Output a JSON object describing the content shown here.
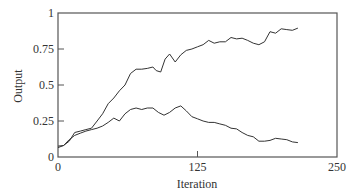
{
  "chart_data": {
    "type": "line",
    "title": "",
    "xlabel": "Iteration",
    "ylabel": "Output",
    "xlim": [
      0,
      250
    ],
    "ylim": [
      0,
      1
    ],
    "xticks": [
      0,
      125,
      250
    ],
    "xtick_labels": [
      "0",
      "125",
      "250"
    ],
    "yticks": [
      0,
      0.25,
      0.5,
      0.75,
      1
    ],
    "ytick_labels": [
      "0",
      "0.25",
      "0.5",
      "0.75",
      "1"
    ],
    "grid": false,
    "legend": null,
    "series": [
      {
        "name": "upper",
        "color": "#333333",
        "x": [
          0,
          5,
          10,
          15,
          20,
          25,
          30,
          35,
          40,
          45,
          50,
          55,
          60,
          65,
          70,
          75,
          80,
          85,
          88,
          92,
          96,
          100,
          105,
          110,
          115,
          120,
          125,
          130,
          135,
          140,
          145,
          150,
          155,
          160,
          165,
          170,
          175,
          180,
          185,
          190,
          195,
          200,
          205,
          210,
          215
        ],
        "y": [
          0.076,
          0.08,
          0.11,
          0.17,
          0.18,
          0.19,
          0.2,
          0.25,
          0.3,
          0.37,
          0.41,
          0.46,
          0.5,
          0.58,
          0.61,
          0.61,
          0.615,
          0.625,
          0.6,
          0.59,
          0.68,
          0.715,
          0.66,
          0.71,
          0.74,
          0.75,
          0.765,
          0.78,
          0.81,
          0.79,
          0.8,
          0.8,
          0.83,
          0.82,
          0.825,
          0.81,
          0.79,
          0.78,
          0.8,
          0.87,
          0.86,
          0.89,
          0.885,
          0.88,
          0.895
        ]
      },
      {
        "name": "lower",
        "color": "#333333",
        "x": [
          0,
          5,
          10,
          15,
          20,
          25,
          30,
          35,
          40,
          45,
          50,
          55,
          60,
          65,
          70,
          75,
          80,
          85,
          90,
          95,
          100,
          105,
          110,
          115,
          120,
          125,
          130,
          135,
          140,
          145,
          150,
          155,
          160,
          165,
          170,
          175,
          180,
          185,
          190,
          195,
          200,
          205,
          210,
          215
        ],
        "y": [
          0.065,
          0.08,
          0.12,
          0.15,
          0.165,
          0.18,
          0.19,
          0.2,
          0.215,
          0.24,
          0.27,
          0.25,
          0.3,
          0.33,
          0.34,
          0.33,
          0.34,
          0.34,
          0.31,
          0.29,
          0.31,
          0.34,
          0.355,
          0.32,
          0.28,
          0.265,
          0.25,
          0.24,
          0.24,
          0.23,
          0.22,
          0.2,
          0.195,
          0.17,
          0.15,
          0.14,
          0.11,
          0.11,
          0.115,
          0.13,
          0.125,
          0.12,
          0.105,
          0.1
        ]
      }
    ]
  }
}
